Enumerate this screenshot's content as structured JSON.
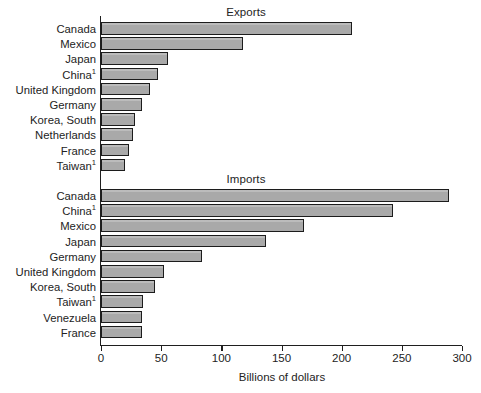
{
  "figure": {
    "xaxis_title": "Billions of dollars",
    "tick_labels": [
      "0",
      "50",
      "100",
      "150",
      "200",
      "250",
      "300"
    ],
    "panels": [
      {
        "key": "exports",
        "title": "Exports"
      },
      {
        "key": "imports",
        "title": "Imports"
      }
    ]
  },
  "exports": {
    "labels": [
      "Canada",
      "Mexico",
      "Japan",
      "China",
      "United Kingdom",
      "Germany",
      "Korea, South",
      "Netherlands",
      "France",
      "Taiwan"
    ],
    "superscripts": [
      "",
      "",
      "",
      "1",
      "",
      "",
      "",
      "",
      "",
      "1"
    ],
    "values": [
      209,
      118,
      56,
      47,
      41,
      34,
      28,
      27,
      23,
      20
    ]
  },
  "imports": {
    "labels": [
      "Canada",
      "China",
      "Mexico",
      "Japan",
      "Germany",
      "United Kingdom",
      "Korea, South",
      "Taiwan",
      "Venezuela",
      "France"
    ],
    "superscripts": [
      "",
      "1",
      "",
      "",
      "",
      "",
      "",
      "1",
      "",
      ""
    ],
    "values": [
      289,
      243,
      169,
      137,
      84,
      52,
      45,
      35,
      34,
      34
    ]
  },
  "chart_data": {
    "type": "bar",
    "orientation": "horizontal",
    "title": "",
    "xlabel": "Billions of dollars",
    "ylabel": "",
    "xlim": [
      0,
      300
    ],
    "xticks": [
      0,
      50,
      100,
      150,
      200,
      250,
      300
    ],
    "grid": false,
    "legend": "none",
    "bar_color": "#a9a9a9",
    "bar_edge_color": "#1c1c1c",
    "panels": [
      {
        "title": "Exports",
        "categories": [
          "Canada",
          "Mexico",
          "Japan",
          "China¹",
          "United Kingdom",
          "Germany",
          "Korea, South",
          "Netherlands",
          "France",
          "Taiwan¹"
        ],
        "values": [
          209,
          118,
          56,
          47,
          41,
          34,
          28,
          27,
          23,
          20
        ]
      },
      {
        "title": "Imports",
        "categories": [
          "Canada",
          "China¹",
          "Mexico",
          "Japan",
          "Germany",
          "United Kingdom",
          "Korea, South",
          "Taiwan¹",
          "Venezuela",
          "France"
        ],
        "values": [
          289,
          243,
          169,
          137,
          84,
          52,
          45,
          35,
          34,
          34
        ]
      }
    ],
    "footnote_marker": "1"
  }
}
